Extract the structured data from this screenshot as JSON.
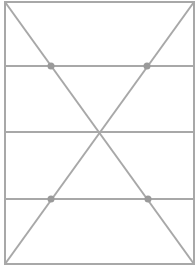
{
  "diagram": {
    "type": "geometry-figure",
    "colors": {
      "stroke": "#a8a8a8",
      "dot": "#9a9a9a",
      "background": "#ffffff"
    },
    "rectangle": {
      "x1": 5,
      "y1": 2,
      "x2": 194,
      "y2": 264
    },
    "horizontal_lines": [
      66,
      132,
      199
    ],
    "diagonals": [
      {
        "from": [
          5,
          2
        ],
        "to": [
          194,
          264
        ]
      },
      {
        "from": [
          194,
          2
        ],
        "to": [
          5,
          264
        ]
      }
    ],
    "dots": [
      {
        "x": 51,
        "y": 66
      },
      {
        "x": 147,
        "y": 66
      },
      {
        "x": 51,
        "y": 199
      },
      {
        "x": 148,
        "y": 199
      }
    ],
    "center": {
      "x": 99,
      "y": 132
    }
  }
}
